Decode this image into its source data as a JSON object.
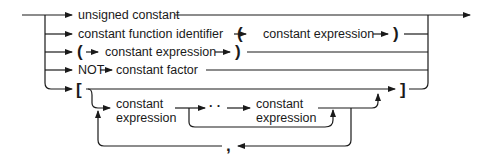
{
  "diagram": {
    "type": "syntax-railroad",
    "rows": [
      {
        "label": "unsigned constant"
      },
      {
        "label": "constant function identifier",
        "open": "(",
        "inner": "constant expression",
        "close": ")"
      },
      {
        "open": "(",
        "inner": "constant expression",
        "close": ")"
      },
      {
        "keyword": "NOT",
        "label": "constant factor"
      },
      {
        "open": "[",
        "close": "]"
      }
    ],
    "set_element": {
      "first_line1": "constant",
      "first_line2": "expression",
      "range_op": "· ·",
      "second_line1": "constant",
      "second_line2": "expression",
      "separator": ","
    },
    "line_color": "#1a1a1a"
  }
}
